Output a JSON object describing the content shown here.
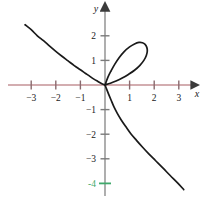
{
  "figure": {
    "title": "",
    "background_color": "#ffffff",
    "width": 209,
    "height": 203
  },
  "axes": {
    "x_axis": {
      "label": "x",
      "color": "#c49296",
      "arrow_color": "#3b3b3b",
      "tick_color": "#8a6a6e",
      "range": [
        -3.9,
        4.0
      ]
    },
    "y_axis": {
      "label": "y",
      "color": "#a6a6a6",
      "arrow_color": "#3b3b3b",
      "tick_color": "#7a7a7a",
      "range": [
        -4.9,
        3.3
      ]
    },
    "highlight": {
      "value": -4,
      "label": "-4",
      "color": "#3fa96b",
      "axis": "y"
    }
  },
  "chart_data": {
    "type": "line",
    "title": "",
    "xlabel": "x",
    "ylabel": "y",
    "xlim": [
      -3.9,
      4.0
    ],
    "ylim": [
      -4.9,
      3.3
    ],
    "grid": false,
    "legend": null,
    "x_ticks": [
      -3,
      -2,
      -1,
      1,
      2,
      3
    ],
    "x_tick_labels": [
      "−3",
      "−2",
      "−1",
      "1",
      "2",
      "3"
    ],
    "y_ticks": [
      2,
      1,
      -1,
      -2,
      -3,
      -4
    ],
    "y_tick_labels": [
      "2",
      "1",
      "−1",
      "−2",
      "−3",
      "−4"
    ],
    "curve_name": "folium-of-descartes",
    "curve_color": "#1a1a1a",
    "curve_width": 1.7,
    "series": [
      {
        "name": "folium-upper-left-branch",
        "points": [
          [
            -3.25,
            2.45
          ],
          [
            -3.0,
            2.25
          ],
          [
            -2.75,
            2.0
          ],
          [
            -2.5,
            1.8
          ],
          [
            -2.25,
            1.58
          ],
          [
            -2.0,
            1.37
          ],
          [
            -1.75,
            1.17
          ],
          [
            -1.5,
            0.98
          ],
          [
            -1.25,
            0.79
          ],
          [
            -1.0,
            0.62
          ],
          [
            -0.8,
            0.48
          ],
          [
            -0.6,
            0.34
          ],
          [
            -0.45,
            0.24
          ],
          [
            -0.3,
            0.15
          ],
          [
            -0.18,
            0.08
          ],
          [
            -0.08,
            0.03
          ],
          [
            0.0,
            0.0
          ]
        ]
      },
      {
        "name": "folium-loop",
        "points": [
          [
            0.0,
            0.0
          ],
          [
            0.12,
            0.32
          ],
          [
            0.25,
            0.58
          ],
          [
            0.4,
            0.85
          ],
          [
            0.58,
            1.12
          ],
          [
            0.78,
            1.36
          ],
          [
            1.0,
            1.55
          ],
          [
            1.2,
            1.67
          ],
          [
            1.38,
            1.73
          ],
          [
            1.52,
            1.72
          ],
          [
            1.63,
            1.65
          ],
          [
            1.7,
            1.53
          ],
          [
            1.72,
            1.38
          ],
          [
            1.68,
            1.2
          ],
          [
            1.58,
            1.0
          ],
          [
            1.42,
            0.8
          ],
          [
            1.2,
            0.6
          ],
          [
            0.95,
            0.43
          ],
          [
            0.7,
            0.28
          ],
          [
            0.45,
            0.16
          ],
          [
            0.22,
            0.07
          ],
          [
            0.0,
            0.0
          ]
        ]
      },
      {
        "name": "folium-lower-right-branch",
        "points": [
          [
            0.0,
            0.0
          ],
          [
            0.07,
            -0.18
          ],
          [
            0.15,
            -0.38
          ],
          [
            0.25,
            -0.62
          ],
          [
            0.36,
            -0.88
          ],
          [
            0.5,
            -1.15
          ],
          [
            0.66,
            -1.42
          ],
          [
            0.85,
            -1.7
          ],
          [
            1.05,
            -1.98
          ],
          [
            1.28,
            -2.25
          ],
          [
            1.52,
            -2.52
          ],
          [
            1.78,
            -2.8
          ],
          [
            2.05,
            -3.07
          ],
          [
            2.35,
            -3.37
          ],
          [
            2.65,
            -3.68
          ],
          [
            2.95,
            -3.98
          ],
          [
            3.2,
            -4.25
          ]
        ]
      }
    ]
  }
}
